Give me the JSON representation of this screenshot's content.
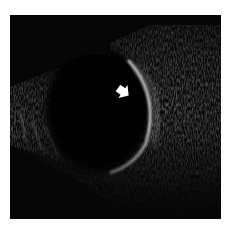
{
  "image": {
    "kind": "ocular B-scan ultrasound",
    "description": "Grayscale B-mode ultrasound of the globe showing an anechoic vitreous cavity bounded by a bright curved posterior wall, with a white arrow pointing at the posterior wall echo",
    "colors": {
      "background": "#ffffff",
      "frame": "#060606",
      "vitreous": "#030303",
      "tissue": "#8a8a8a",
      "echo_highlight": "#e6e6e6",
      "arrow": "#ffffff"
    },
    "annotations": [
      {
        "type": "arrow",
        "direction": "down-right",
        "color": "#ffffff",
        "position": {
          "x": 118,
          "y": 92
        }
      }
    ]
  }
}
